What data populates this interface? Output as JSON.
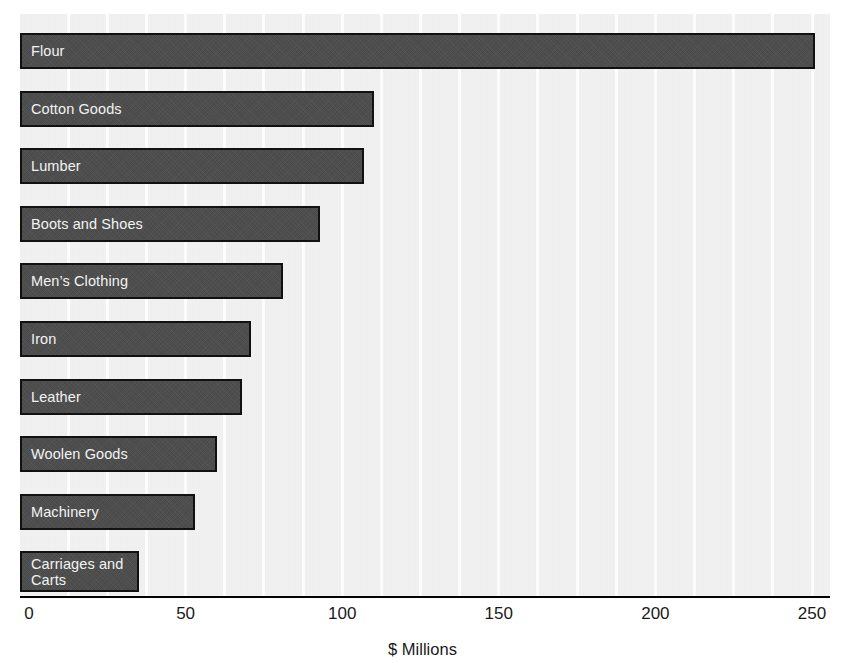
{
  "chart_data": {
    "type": "bar",
    "orientation": "horizontal",
    "title": "",
    "subtitle": "",
    "xlabel": "$ Millions",
    "ylabel": "",
    "xlim": [
      0,
      250
    ],
    "xticks": [
      0,
      50,
      100,
      150,
      200,
      250
    ],
    "xticklabels": [
      "0",
      "50",
      "100",
      "150",
      "200",
      "250"
    ],
    "grid": true,
    "grid_axis": "x",
    "grid_interval": 12.5,
    "legend": null,
    "categories": [
      "Flour",
      "Cotton Goods",
      "Lumber",
      "Boots and Shoes",
      "Men’s Clothing",
      "Iron",
      "Leather",
      "Woolen Goods",
      "Machinery",
      "Carriages and\nCarts"
    ],
    "values": [
      251,
      110,
      107,
      93,
      81,
      71,
      68,
      60,
      53,
      35
    ],
    "bar_color": "#4a4a4a",
    "bar_edge_color": "#111111",
    "label_color": "#f2f2f2",
    "panel_color": "#ececec",
    "gridline_color": "#fbfbfb",
    "axis_color": "#000000",
    "tick_text_color": "#1a1a1a"
  },
  "axis": {
    "title": "$ Millions"
  }
}
